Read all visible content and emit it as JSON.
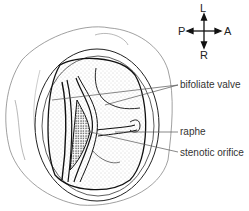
{
  "diagram": {
    "labels": [
      {
        "id": "bifoliate",
        "text": "bifoliate valve"
      },
      {
        "id": "raphe",
        "text": "raphe"
      },
      {
        "id": "stenotic",
        "text": "stenotic orifice"
      }
    ],
    "compass": {
      "up": "L",
      "down": "R",
      "left": "P",
      "right": "A"
    },
    "colors": {
      "line": "#222222",
      "leader": "#555555",
      "stipple": "#9a9a9a"
    }
  }
}
